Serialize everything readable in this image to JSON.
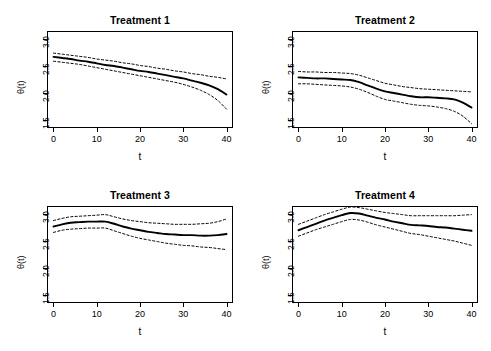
{
  "figure": {
    "layout": "2x2 panel grid",
    "background": "#ffffff",
    "line_color": "#000000"
  },
  "chart_data": [
    {
      "type": "line",
      "title": "Treatment 1",
      "xlabel": "t",
      "ylabel": "θ(t)",
      "xlim": [
        -1.5,
        41.5
      ],
      "ylim": [
        1.35,
        3.15
      ],
      "xticks": [
        0,
        10,
        20,
        30,
        40
      ],
      "xtick_labels": [
        "0",
        "10",
        "20",
        "30",
        "40"
      ],
      "yticks": [
        1.5,
        2.0,
        2.5,
        3.0
      ],
      "ytick_labels": [
        "1.5",
        "2.0",
        "2.5",
        "3.0"
      ],
      "grid": false,
      "legend": "none",
      "x": [
        0,
        2,
        4,
        6,
        8,
        10,
        12,
        14,
        16,
        18,
        20,
        22,
        24,
        26,
        28,
        30,
        32,
        34,
        36,
        38,
        40
      ],
      "series": [
        {
          "name": "estimate",
          "style": "solid",
          "values": [
            2.67,
            2.65,
            2.63,
            2.6,
            2.58,
            2.55,
            2.52,
            2.5,
            2.47,
            2.44,
            2.41,
            2.39,
            2.36,
            2.33,
            2.3,
            2.27,
            2.23,
            2.19,
            2.14,
            2.07,
            1.97
          ]
        },
        {
          "name": "upper-confidence-band",
          "style": "dashed",
          "values": [
            2.74,
            2.72,
            2.7,
            2.68,
            2.66,
            2.63,
            2.61,
            2.59,
            2.56,
            2.54,
            2.51,
            2.49,
            2.46,
            2.44,
            2.41,
            2.39,
            2.36,
            2.34,
            2.31,
            2.29,
            2.26
          ]
        },
        {
          "name": "lower-confidence-band",
          "style": "dashed",
          "values": [
            2.59,
            2.57,
            2.55,
            2.53,
            2.5,
            2.47,
            2.44,
            2.41,
            2.38,
            2.35,
            2.32,
            2.29,
            2.26,
            2.23,
            2.2,
            2.16,
            2.11,
            2.05,
            1.97,
            1.86,
            1.7
          ]
        }
      ]
    },
    {
      "type": "line",
      "title": "Treatment 2",
      "xlabel": "t",
      "ylabel": "θ(t)",
      "xlim": [
        -1.5,
        41.5
      ],
      "ylim": [
        1.35,
        3.15
      ],
      "xticks": [
        0,
        10,
        20,
        30,
        40
      ],
      "xtick_labels": [
        "0",
        "10",
        "20",
        "30",
        "40"
      ],
      "yticks": [
        1.5,
        2.0,
        2.5,
        3.0
      ],
      "ytick_labels": [
        "1.5",
        "2.0",
        "2.5",
        "3.0"
      ],
      "grid": false,
      "legend": "none",
      "x": [
        0,
        2,
        4,
        6,
        8,
        10,
        12,
        14,
        16,
        18,
        20,
        22,
        24,
        26,
        28,
        30,
        32,
        34,
        36,
        38,
        40
      ],
      "series": [
        {
          "name": "estimate",
          "style": "solid",
          "values": [
            2.29,
            2.28,
            2.27,
            2.27,
            2.26,
            2.25,
            2.24,
            2.2,
            2.14,
            2.08,
            2.03,
            2.0,
            1.97,
            1.94,
            1.92,
            1.92,
            1.91,
            1.9,
            1.88,
            1.82,
            1.73
          ]
        },
        {
          "name": "upper-confidence-band",
          "style": "dashed",
          "values": [
            2.4,
            2.39,
            2.39,
            2.38,
            2.38,
            2.37,
            2.36,
            2.33,
            2.28,
            2.23,
            2.18,
            2.15,
            2.12,
            2.1,
            2.08,
            2.07,
            2.06,
            2.05,
            2.04,
            2.03,
            2.02
          ]
        },
        {
          "name": "lower-confidence-band",
          "style": "dashed",
          "values": [
            2.17,
            2.17,
            2.16,
            2.15,
            2.14,
            2.13,
            2.11,
            2.07,
            2.01,
            1.94,
            1.88,
            1.85,
            1.82,
            1.79,
            1.77,
            1.76,
            1.74,
            1.71,
            1.66,
            1.57,
            1.43
          ]
        }
      ]
    },
    {
      "type": "line",
      "title": "Treatment 3",
      "xlabel": "t",
      "ylabel": "θ(t)",
      "xlim": [
        -1.5,
        41.5
      ],
      "ylim": [
        1.35,
        3.15
      ],
      "xticks": [
        0,
        10,
        20,
        30,
        40
      ],
      "xtick_labels": [
        "0",
        "10",
        "20",
        "30",
        "40"
      ],
      "yticks": [
        1.5,
        2.0,
        2.5,
        3.0
      ],
      "ytick_labels": [
        "1.5",
        "2.0",
        "2.5",
        "3.0"
      ],
      "grid": false,
      "legend": "none",
      "x": [
        0,
        2,
        4,
        6,
        8,
        10,
        12,
        14,
        16,
        18,
        20,
        22,
        24,
        26,
        28,
        30,
        32,
        34,
        36,
        38,
        40
      ],
      "series": [
        {
          "name": "estimate",
          "style": "solid",
          "values": [
            2.77,
            2.81,
            2.84,
            2.85,
            2.86,
            2.86,
            2.86,
            2.82,
            2.77,
            2.73,
            2.7,
            2.67,
            2.65,
            2.63,
            2.62,
            2.61,
            2.61,
            2.6,
            2.6,
            2.61,
            2.63
          ]
        },
        {
          "name": "upper-confidence-band",
          "style": "dashed",
          "values": [
            2.88,
            2.92,
            2.95,
            2.96,
            2.97,
            2.98,
            2.99,
            2.95,
            2.91,
            2.88,
            2.86,
            2.84,
            2.83,
            2.82,
            2.81,
            2.81,
            2.81,
            2.82,
            2.83,
            2.86,
            2.91
          ]
        },
        {
          "name": "lower-confidence-band",
          "style": "dashed",
          "values": [
            2.66,
            2.7,
            2.72,
            2.73,
            2.74,
            2.74,
            2.74,
            2.69,
            2.64,
            2.59,
            2.55,
            2.52,
            2.49,
            2.46,
            2.44,
            2.42,
            2.41,
            2.39,
            2.38,
            2.36,
            2.34
          ]
        }
      ]
    },
    {
      "type": "line",
      "title": "Treatment 4",
      "xlabel": "t",
      "ylabel": "θ(t)",
      "xlim": [
        -1.5,
        41.5
      ],
      "ylim": [
        1.35,
        3.15
      ],
      "xticks": [
        0,
        10,
        20,
        30,
        40
      ],
      "xtick_labels": [
        "0",
        "10",
        "20",
        "30",
        "40"
      ],
      "yticks": [
        1.5,
        2.0,
        2.5,
        3.0
      ],
      "ytick_labels": [
        "1.5",
        "2.0",
        "2.5",
        "3.0"
      ],
      "grid": false,
      "legend": "none",
      "x": [
        0,
        2,
        4,
        6,
        8,
        10,
        12,
        14,
        16,
        18,
        20,
        22,
        24,
        26,
        28,
        30,
        32,
        34,
        36,
        38,
        40
      ],
      "series": [
        {
          "name": "estimate",
          "style": "solid",
          "values": [
            2.7,
            2.76,
            2.82,
            2.88,
            2.93,
            2.98,
            3.02,
            3.01,
            2.97,
            2.93,
            2.9,
            2.86,
            2.83,
            2.8,
            2.79,
            2.78,
            2.76,
            2.75,
            2.73,
            2.71,
            2.69
          ]
        },
        {
          "name": "upper-confidence-band",
          "style": "dashed",
          "values": [
            2.81,
            2.87,
            2.93,
            2.99,
            3.04,
            3.09,
            3.13,
            3.12,
            3.09,
            3.06,
            3.03,
            3.01,
            2.99,
            2.97,
            2.97,
            2.97,
            2.97,
            2.97,
            2.97,
            2.98,
            2.99
          ]
        },
        {
          "name": "lower-confidence-band",
          "style": "dashed",
          "values": [
            2.59,
            2.65,
            2.71,
            2.76,
            2.81,
            2.86,
            2.9,
            2.89,
            2.85,
            2.8,
            2.76,
            2.72,
            2.68,
            2.64,
            2.62,
            2.59,
            2.56,
            2.53,
            2.5,
            2.46,
            2.42
          ]
        }
      ]
    }
  ]
}
